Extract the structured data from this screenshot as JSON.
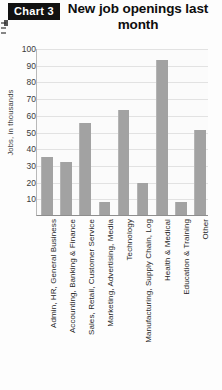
{
  "badge": {
    "label": "Chart 3"
  },
  "header": {
    "title": "New job openings last month"
  },
  "chart_data": {
    "type": "bar",
    "title": "New job openings last month",
    "xlabel": "",
    "ylabel": "Jobs, in thousands",
    "ylim": [
      0,
      100
    ],
    "yticks": [
      100,
      90,
      80,
      70,
      60,
      50,
      40,
      30,
      20,
      10
    ],
    "grid": true,
    "legend": "none",
    "bar_color": "#a2a2a2",
    "categories": [
      "Admin, HR, General Business",
      "Accounting, Banking & Finance",
      "Sales, Retail, Customer Service",
      "Marketing, Advertising, Media",
      "Technology",
      "Manufacturing, Supply Chain, Log",
      "Health & Medical",
      "Education & Training",
      "Other"
    ],
    "values": [
      35,
      32,
      55,
      8,
      63,
      19,
      93,
      8,
      51
    ]
  }
}
